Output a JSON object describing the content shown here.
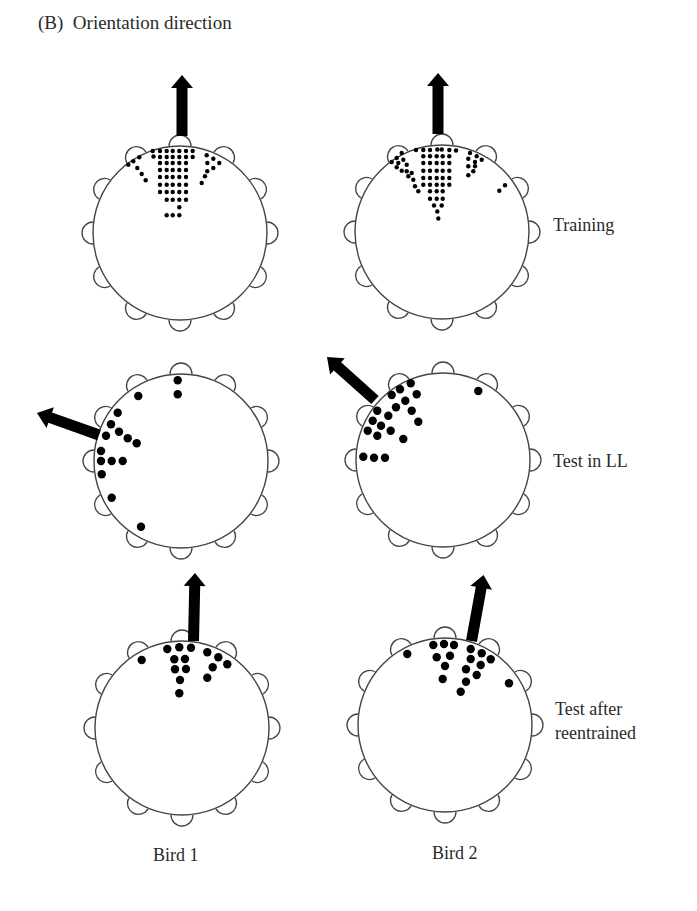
{
  "figure": {
    "panel_title": "(B)  Orientation direction",
    "row_labels": [
      "Training",
      "Test in LL",
      "Test after",
      "reentrained"
    ],
    "column_labels": [
      "Bird 1",
      "Bird 2"
    ],
    "colors": {
      "ink": "#000000",
      "line": "#444444",
      "background": "#ffffff"
    }
  },
  "chart_data": {
    "type": "scatter",
    "title": "(B) Orientation direction",
    "rows": [
      "Training",
      "Test in LL",
      "Test after reentrained"
    ],
    "columns": [
      "Bird 1",
      "Bird 2"
    ],
    "arena": {
      "perches": 12,
      "radius_px": 87,
      "perch_radius_px": 11
    },
    "panels": [
      {
        "bird": "Bird 1",
        "condition": "Training",
        "center": [
          180,
          233
        ],
        "arrow": {
          "tip": [
            182,
            75
          ],
          "base": [
            182,
            136
          ],
          "width": 11,
          "head_width": 22,
          "head_len": 13
        },
        "dots_r": 2.2,
        "dots": [
          [
            152.7,
            151
          ],
          [
            160,
            151
          ],
          [
            166.7,
            151
          ],
          [
            172.7,
            151
          ],
          [
            179.3,
            151
          ],
          [
            186,
            151
          ],
          [
            192.7,
            151
          ],
          [
            153.5,
            156.5
          ],
          [
            160,
            157
          ],
          [
            166.7,
            157
          ],
          [
            172.7,
            157
          ],
          [
            179.3,
            157
          ],
          [
            186,
            157
          ],
          [
            192.7,
            157
          ],
          [
            160,
            163
          ],
          [
            166.7,
            163
          ],
          [
            172.7,
            163
          ],
          [
            179.3,
            163
          ],
          [
            186,
            163
          ],
          [
            160,
            170
          ],
          [
            166.7,
            170
          ],
          [
            172.7,
            170
          ],
          [
            179.3,
            170
          ],
          [
            186,
            170
          ],
          [
            160,
            177
          ],
          [
            166.7,
            177
          ],
          [
            172.7,
            177
          ],
          [
            179.3,
            177
          ],
          [
            186,
            177
          ],
          [
            160,
            184.7
          ],
          [
            166.7,
            184.7
          ],
          [
            172.7,
            184.7
          ],
          [
            179.3,
            184.7
          ],
          [
            186,
            184.7
          ],
          [
            160,
            192
          ],
          [
            166.7,
            192
          ],
          [
            172.7,
            192
          ],
          [
            179.3,
            192
          ],
          [
            186,
            192
          ],
          [
            166.7,
            199.7
          ],
          [
            172.7,
            199.7
          ],
          [
            179.3,
            199.7
          ],
          [
            186,
            199.7
          ],
          [
            179.3,
            207.3
          ],
          [
            166.7,
            215.3
          ],
          [
            172.7,
            215.3
          ],
          [
            179.3,
            215.3
          ],
          [
            139.3,
            157.3
          ],
          [
            133.3,
            161.3
          ],
          [
            128.3,
            164.7
          ],
          [
            137.3,
            168
          ],
          [
            141.7,
            174
          ],
          [
            145.7,
            180.3
          ],
          [
            206.7,
            155.3
          ],
          [
            213.3,
            158.7
          ],
          [
            219.3,
            163
          ],
          [
            207.3,
            163
          ],
          [
            213.3,
            168
          ],
          [
            207.3,
            171.3
          ],
          [
            205,
            176.3
          ],
          [
            201.7,
            183
          ]
        ]
      },
      {
        "bird": "Bird 2",
        "condition": "Training",
        "center": [
          442,
          232
        ],
        "arrow": {
          "tip": [
            438,
            73
          ],
          "base": [
            438,
            134
          ],
          "width": 11,
          "head_width": 22,
          "head_len": 13
        },
        "dots_r": 2.2,
        "dots": [
          [
            416,
            150
          ],
          [
            423.3,
            150
          ],
          [
            430,
            150
          ],
          [
            437.3,
            149.5
          ],
          [
            441.7,
            149.5
          ],
          [
            449.3,
            150
          ],
          [
            456,
            150.5
          ],
          [
            423.3,
            156.3
          ],
          [
            430,
            156.3
          ],
          [
            436.7,
            156.3
          ],
          [
            442.7,
            156.3
          ],
          [
            449.3,
            156.3
          ],
          [
            423.3,
            163
          ],
          [
            430,
            163
          ],
          [
            436.7,
            163
          ],
          [
            442.7,
            163
          ],
          [
            449.3,
            163
          ],
          [
            423.3,
            170.7
          ],
          [
            430,
            170.7
          ],
          [
            436.7,
            170.7
          ],
          [
            442.7,
            170.7
          ],
          [
            449.3,
            170.7
          ],
          [
            423.3,
            178
          ],
          [
            430,
            178
          ],
          [
            436.7,
            178
          ],
          [
            442.7,
            178
          ],
          [
            449.3,
            178
          ],
          [
            423.3,
            184.7
          ],
          [
            430,
            184.7
          ],
          [
            436.7,
            184.7
          ],
          [
            442.7,
            184.7
          ],
          [
            449.3,
            184.7
          ],
          [
            430,
            191.3
          ],
          [
            436.7,
            191.3
          ],
          [
            442.7,
            191.3
          ],
          [
            430,
            198.7
          ],
          [
            436.7,
            198.7
          ],
          [
            442.7,
            198.7
          ],
          [
            434,
            205.5
          ],
          [
            441.7,
            205.5
          ],
          [
            437.3,
            211.5
          ],
          [
            438.3,
            218.5
          ],
          [
            401.7,
            153
          ],
          [
            396.7,
            158
          ],
          [
            391.7,
            162
          ],
          [
            403.3,
            159.7
          ],
          [
            398.3,
            163
          ],
          [
            406.7,
            164.7
          ],
          [
            396.7,
            167.3
          ],
          [
            401.7,
            170.7
          ],
          [
            406.7,
            171.3
          ],
          [
            411.7,
            173
          ],
          [
            408.3,
            176.3
          ],
          [
            413.3,
            179.7
          ],
          [
            415,
            186.3
          ],
          [
            418.3,
            191.3
          ],
          [
            470,
            153
          ],
          [
            476.7,
            156.3
          ],
          [
            481.7,
            159.7
          ],
          [
            468.3,
            158.7
          ],
          [
            475,
            162
          ],
          [
            468.3,
            166.3
          ],
          [
            475,
            166.3
          ],
          [
            473.3,
            171.3
          ],
          [
            468.3,
            175.3
          ],
          [
            505,
            185.3
          ],
          [
            499.3,
            190.7
          ]
        ]
      },
      {
        "bird": "Bird 1",
        "condition": "Test in LL",
        "center": [
          181,
          461
        ],
        "arrow": {
          "tip": [
            37,
            413
          ],
          "base": [
            99,
            435
          ],
          "width": 11,
          "head_width": 22,
          "head_len": 14
        },
        "dots_r": 4.2,
        "dots": [
          [
            177.7,
            380.3
          ],
          [
            177.7,
            394.3
          ],
          [
            138.3,
            396
          ],
          [
            117.7,
            412.7
          ],
          [
            111,
            424.3
          ],
          [
            119,
            431.7
          ],
          [
            106,
            435.7
          ],
          [
            127.7,
            438.3
          ],
          [
            136.7,
            443.3
          ],
          [
            101,
            451
          ],
          [
            101,
            461
          ],
          [
            111.7,
            461
          ],
          [
            122.7,
            461
          ],
          [
            101.7,
            474.3
          ],
          [
            111.7,
            497.7
          ],
          [
            141,
            526.7
          ]
        ]
      },
      {
        "bird": "Bird 2",
        "condition": "Test in LL",
        "center": [
          443,
          460
        ],
        "arrow": {
          "tip": [
            327,
            357
          ],
          "base": [
            375,
            400
          ],
          "width": 11,
          "head_width": 22,
          "head_len": 14
        },
        "dots_r": 4.2,
        "dots": [
          [
            410.7,
            383.3
          ],
          [
            400,
            389.3
          ],
          [
            391.7,
            395
          ],
          [
            416.7,
            394.3
          ],
          [
            405.3,
            400.7
          ],
          [
            396,
            407.3
          ],
          [
            411.7,
            410.7
          ],
          [
            377.3,
            410.7
          ],
          [
            388.3,
            415.7
          ],
          [
            372.7,
            420.7
          ],
          [
            418.3,
            421.7
          ],
          [
            381,
            425.7
          ],
          [
            367.7,
            430.7
          ],
          [
            390.7,
            430.7
          ],
          [
            377.3,
            435.7
          ],
          [
            403.3,
            439
          ],
          [
            363.3,
            456.7
          ],
          [
            374,
            457.7
          ],
          [
            385,
            457.7
          ],
          [
            478.3,
            391
          ]
        ]
      },
      {
        "bird": "Bird 1",
        "condition": "Test after reentrained",
        "center": [
          182,
          728
        ],
        "arrow": {
          "tip": [
            195,
            573
          ],
          "base": [
            193.5,
            641
          ],
          "width": 11,
          "head_width": 22,
          "head_len": 13
        },
        "dots_r": 4.2,
        "dots": [
          [
            167.3,
            649
          ],
          [
            179.3,
            647.3
          ],
          [
            191,
            647.7
          ],
          [
            141.7,
            660
          ],
          [
            174.3,
            659.3
          ],
          [
            185,
            659
          ],
          [
            207.3,
            652.3
          ],
          [
            218.3,
            657.3
          ],
          [
            227.3,
            664.3
          ],
          [
            175,
            669.3
          ],
          [
            186,
            669
          ],
          [
            212.7,
            667.3
          ],
          [
            180,
            680
          ],
          [
            207.3,
            677.7
          ],
          [
            179.3,
            693.3
          ]
        ]
      },
      {
        "bird": "Bird 2",
        "condition": "Test after reentrained",
        "center": [
          445,
          725
        ],
        "arrow": {
          "tip": [
            483.5,
            575
          ],
          "base": [
            471.5,
            641
          ],
          "width": 11,
          "head_width": 22,
          "head_len": 13
        },
        "dots_r": 4.2,
        "dots": [
          [
            407.3,
            654
          ],
          [
            433.3,
            645
          ],
          [
            444,
            644
          ],
          [
            454,
            645
          ],
          [
            436.7,
            657.3
          ],
          [
            450,
            655.7
          ],
          [
            470.7,
            649
          ],
          [
            481.7,
            653.3
          ],
          [
            490.7,
            659.3
          ],
          [
            470.7,
            659
          ],
          [
            445,
            666
          ],
          [
            480.7,
            665
          ],
          [
            466,
            669.3
          ],
          [
            476.7,
            675
          ],
          [
            442.7,
            679
          ],
          [
            466,
            681.7
          ],
          [
            460.7,
            691.7
          ],
          [
            509,
            683.3
          ]
        ]
      }
    ]
  }
}
